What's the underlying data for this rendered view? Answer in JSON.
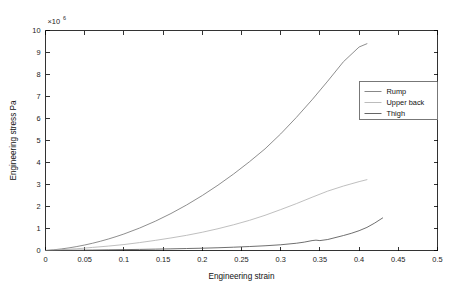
{
  "chart_data": {
    "type": "line",
    "title": "",
    "xlabel": "Engineering strain",
    "ylabel": "Engineering stress Pa",
    "y_exponent_text": "×10",
    "y_exponent_power": "6",
    "xlim": [
      0,
      0.5
    ],
    "ylim": [
      0,
      10
    ],
    "xticks": [
      0,
      0.05,
      0.1,
      0.15,
      0.2,
      0.25,
      0.3,
      0.35,
      0.4,
      0.45,
      0.5
    ],
    "xtick_labels": [
      "0",
      "0.05",
      "0.1",
      "0.15",
      "0.2",
      "0.25",
      "0.3",
      "0.35",
      "0.4",
      "0.45",
      "0.5"
    ],
    "yticks": [
      0,
      1,
      2,
      3,
      4,
      5,
      6,
      7,
      8,
      9,
      10
    ],
    "ytick_labels": [
      "0",
      "1",
      "2",
      "3",
      "4",
      "5",
      "6",
      "7",
      "8",
      "9",
      "10"
    ],
    "grid": false,
    "legend_position": "right",
    "y_scale_factor": 1000000,
    "series": [
      {
        "name": "Rump",
        "color": "#7a7a7a",
        "x": [
          0,
          0.01,
          0.02,
          0.03,
          0.04,
          0.05,
          0.06,
          0.07,
          0.08,
          0.09,
          0.1,
          0.12,
          0.14,
          0.16,
          0.18,
          0.2,
          0.22,
          0.24,
          0.26,
          0.28,
          0.3,
          0.32,
          0.34,
          0.36,
          0.38,
          0.4,
          0.41
        ],
        "values": [
          0,
          0.03,
          0.07,
          0.12,
          0.18,
          0.25,
          0.33,
          0.42,
          0.52,
          0.63,
          0.75,
          1.02,
          1.33,
          1.68,
          2.07,
          2.5,
          2.97,
          3.48,
          4.03,
          4.62,
          5.3,
          6.05,
          6.85,
          7.7,
          8.58,
          9.25,
          9.4
        ]
      },
      {
        "name": "Upper back",
        "color": "#b4b4b4",
        "x": [
          0,
          0.01,
          0.02,
          0.03,
          0.04,
          0.05,
          0.06,
          0.08,
          0.1,
          0.12,
          0.14,
          0.16,
          0.18,
          0.2,
          0.22,
          0.24,
          0.26,
          0.28,
          0.3,
          0.32,
          0.34,
          0.36,
          0.38,
          0.4,
          0.41
        ],
        "values": [
          0,
          0.02,
          0.04,
          0.06,
          0.08,
          0.11,
          0.14,
          0.2,
          0.27,
          0.36,
          0.46,
          0.57,
          0.69,
          0.83,
          0.99,
          1.17,
          1.37,
          1.6,
          1.86,
          2.13,
          2.42,
          2.7,
          2.93,
          3.13,
          3.22
        ]
      },
      {
        "name": "Thigh",
        "color": "#555555",
        "x": [
          0,
          0.02,
          0.04,
          0.06,
          0.08,
          0.1,
          0.12,
          0.14,
          0.16,
          0.18,
          0.2,
          0.22,
          0.24,
          0.26,
          0.28,
          0.3,
          0.32,
          0.33,
          0.34,
          0.345,
          0.35,
          0.36,
          0.38,
          0.39,
          0.4,
          0.41,
          0.42,
          0.43
        ],
        "values": [
          0,
          0.005,
          0.012,
          0.02,
          0.03,
          0.04,
          0.05,
          0.062,
          0.075,
          0.09,
          0.105,
          0.125,
          0.15,
          0.18,
          0.215,
          0.26,
          0.33,
          0.38,
          0.45,
          0.47,
          0.45,
          0.5,
          0.68,
          0.78,
          0.9,
          1.05,
          1.25,
          1.48
        ]
      }
    ]
  },
  "legend": {
    "items": [
      {
        "label": "Rump"
      },
      {
        "label": "Upper back"
      },
      {
        "label": "Thigh"
      }
    ]
  }
}
